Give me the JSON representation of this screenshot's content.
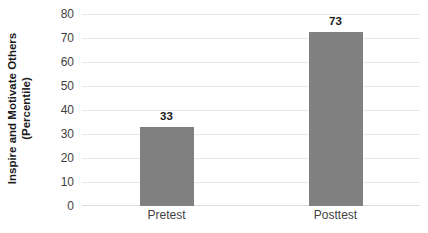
{
  "chart_data": {
    "type": "bar",
    "title": "",
    "subtitle": "",
    "xlabel": "",
    "ylabel": "Inspire and Motivate Others (Percentile)",
    "ylabel_lines": [
      "Inspire and Motivate Others",
      "(Percentile)"
    ],
    "categories": [
      "Pretest",
      "Posttest"
    ],
    "values": [
      33,
      73
    ],
    "data_labels": [
      "33",
      "73"
    ],
    "ylim": [
      0,
      80
    ],
    "ytick_step": 10,
    "yticks": [
      80,
      70,
      60,
      50,
      40,
      30,
      20,
      10,
      0
    ],
    "ytick_labels": [
      "80",
      "70",
      "60",
      "50",
      "40",
      "30",
      "20",
      "10",
      "0"
    ],
    "grid": true,
    "grid_axis": "y",
    "legend": false,
    "legend_position": "none",
    "bar_color": "#808080",
    "gridline_color": "#e8e8e8",
    "background_color": "#ffffff",
    "text_color": "#3f3f3f"
  }
}
